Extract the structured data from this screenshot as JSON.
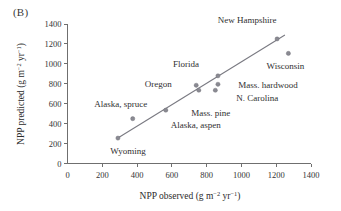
{
  "figure": {
    "panel_label": "(B)",
    "background_color": "#ffffff",
    "point_color": "#8a8a92",
    "line_color": "#7a7a82",
    "axis_color": "#6f6f6f"
  },
  "chart_data": {
    "type": "scatter",
    "title": "",
    "xlabel": "NPP observed (g m−2 yr−1)",
    "ylabel": "NPP predicted (g m−2 yr−1)",
    "xlabel_parts": {
      "main": "NPP observed (g m",
      "sup1": "−2",
      "mid": " yr",
      "sup2": "−1",
      "tail": ")"
    },
    "ylabel_parts": {
      "main": "NPP predicted (g m",
      "sup1": "−2",
      "mid": " yr",
      "sup2": "−1",
      "tail": ")"
    },
    "xlim": [
      0,
      1400
    ],
    "ylim": [
      0,
      1400
    ],
    "xticks": [
      0,
      200,
      400,
      600,
      800,
      1000,
      1200,
      1400
    ],
    "yticks": [
      0,
      200,
      400,
      600,
      800,
      1000,
      1200,
      1400
    ],
    "xticklabels": [
      "0",
      "200",
      "400",
      "600",
      "800",
      "1000",
      "1200",
      "1400"
    ],
    "yticklabels": [
      "0",
      "200",
      "400",
      "600",
      "800",
      "1000",
      "1200",
      "1400"
    ],
    "grid": false,
    "legend": false,
    "points": [
      {
        "label": "Wyoming",
        "x": 290,
        "y": 255,
        "label_dx": 10,
        "label_dy": 16,
        "anchor": "middle"
      },
      {
        "label": "Alaska, spruce",
        "x": 375,
        "y": 450,
        "label_dx": -12,
        "label_dy": -12,
        "anchor": "middle"
      },
      {
        "label": "Alaska, aspen",
        "x": 565,
        "y": 535,
        "label_dx": 30,
        "label_dy": 18,
        "anchor": "middle"
      },
      {
        "label": "Oregon",
        "x": 740,
        "y": 785,
        "label_dx": -38,
        "label_dy": 2,
        "anchor": "middle"
      },
      {
        "label": "Mass. pine",
        "x": 755,
        "y": 735,
        "label_dx": 12,
        "label_dy": 26,
        "anchor": "middle"
      },
      {
        "label": "Florida",
        "x": 865,
        "y": 880,
        "label_dx": -32,
        "label_dy": -9,
        "anchor": "middle"
      },
      {
        "label": "Mass. hardwood",
        "x": 865,
        "y": 795,
        "label_dx": 50,
        "label_dy": 4,
        "anchor": "middle"
      },
      {
        "label": "N. Carolina",
        "x": 850,
        "y": 735,
        "label_dx": 42,
        "label_dy": 11,
        "anchor": "middle"
      },
      {
        "label": "New Hampshire",
        "x": 1205,
        "y": 1250,
        "label_dx": -30,
        "label_dy": -16,
        "anchor": "middle"
      },
      {
        "label": "Wisconsin",
        "x": 1270,
        "y": 1105,
        "label_dx": -3,
        "label_dy": 16,
        "anchor": "middle"
      }
    ],
    "fit_line": {
      "x1": 285,
      "y1": 250,
      "x2": 1250,
      "y2": 1290
    }
  }
}
